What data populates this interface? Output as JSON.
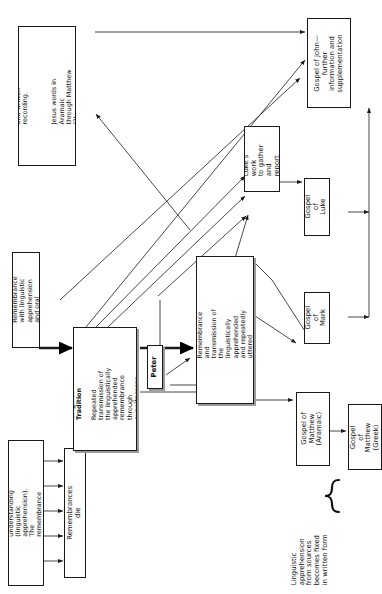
{
  "diagram": {
    "orientation": "rotated-90-ccw",
    "line_color": "#1a1a1a",
    "box_fill": "#ffffff",
    "nodes": [
      {
        "id": "remembrance1",
        "label": "1. Remembrance with little or\nno understanding (linguistic\napprehension). The\nremembrance dies when\nwitnesses pass from the\nscene."
      },
      {
        "id": "remembrances-die",
        "label": "Remembrances die"
      },
      {
        "id": "remembrance2",
        "label": "2. Remembrance with linguistic\napprehension and oral\nexpression."
      },
      {
        "id": "remembrance3",
        "label": "3. Remembrance with linguistic\napprehension and written\nrecording.",
        "label2": "Jesus words in Aramaic\nthrough Matthew (?)\nJesus' speeches through\nJohn (?)"
      },
      {
        "id": "original-tradition",
        "label_bold": "Original Tradition",
        "label": "Repeated transmission of\nthe linguistically\napprehended\nremembrance through\neyewitnesses."
      },
      {
        "id": "peter",
        "label": "Peter"
      },
      {
        "id": "secondary-tradition",
        "label_bold": "Secondary Tradition",
        "label": "Remembrance and\ntransmission of the\nlinguistically apprehended\nand repeatedly uttered\nremembrances of\neyewitnesses."
      },
      {
        "id": "lukes-work",
        "label": "Luke's work\nto gather\nand report"
      },
      {
        "id": "gospel-john",
        "label": "Gospel of John—\nfurther\ninformation and\nsupplementation"
      },
      {
        "id": "gospel-luke",
        "label": "Gospel\nof Luke"
      },
      {
        "id": "gospel-mark",
        "label": "Gospel\nof Mark"
      },
      {
        "id": "gospel-matthew-aramaic",
        "label": "Gospel of\nMatthew\n(Aramaic)"
      },
      {
        "id": "gospel-matthew-greek",
        "label": "Gospel of\nMatthew\n(Greek)"
      }
    ],
    "brace_caption": "Linguistic\napprehension\nfrom sources\nbecomes fixed\nin written form"
  }
}
